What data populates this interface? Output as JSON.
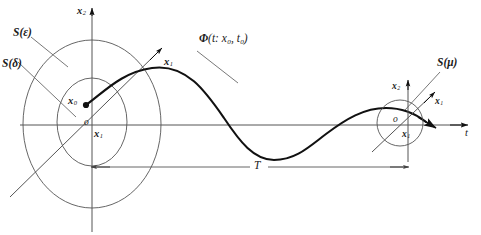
{
  "figure": {
    "kind": "lyapunov-stability-diagram",
    "background": "#ffffff",
    "stroke_color": "#333333",
    "curve_color": "#111111",
    "width": 481,
    "height": 235
  },
  "axes": {
    "vertical_left_label": "x",
    "vertical_left_sub": "2",
    "horizontal_left_label": "x",
    "horizontal_left_sub": "1",
    "diagonal_left_label": "x",
    "diagonal_left_sub": "1",
    "origin_left": "o",
    "vertical_right_label": "x",
    "vertical_right_sub": "2",
    "horizontal_right_label": "x",
    "horizontal_right_sub": "1",
    "diagonal_right_label": "x",
    "diagonal_right_sub": "1",
    "origin_right": "o",
    "time_axis_label": "t"
  },
  "regions": {
    "outer_ellipse": "S(ε)",
    "inner_ellipse": "S(δ)",
    "right_circle": "S(μ)"
  },
  "points": {
    "initial_state_label": "x",
    "initial_state_sub": "0"
  },
  "trajectory": {
    "label_phi": "Φ",
    "label_args": "(t:  x",
    "label_sub1": "0",
    "label_mid": ",  t",
    "label_sub2": "0",
    "label_close": ")"
  },
  "dimension": {
    "span_label": "T"
  }
}
